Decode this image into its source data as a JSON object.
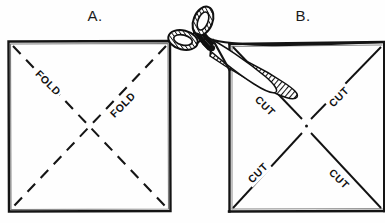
{
  "figure": {
    "background_color": "#fefefe",
    "ink_color": "#141414",
    "panels": [
      {
        "key": "A",
        "letter": "A.",
        "letter_x": 95,
        "letter_y": 21,
        "square": {
          "x": 8,
          "y": 41,
          "size": 162
        },
        "diagonal_style": "dashed",
        "labels": [
          {
            "text": "FOLD",
            "x": 47,
            "y": 84,
            "rotation": 45
          },
          {
            "text": "FOLD",
            "x": 124,
            "y": 106,
            "rotation": -45
          }
        ]
      },
      {
        "key": "B",
        "letter": "B.",
        "letter_x": 303,
        "letter_y": 21,
        "square": {
          "x": 229,
          "y": 41,
          "size": 162
        },
        "diagonal_style": "solid",
        "labels": [
          {
            "text": "CUT",
            "x": 264,
            "y": 107,
            "rotation": 45
          },
          {
            "text": "CUT",
            "x": 340,
            "y": 98,
            "rotation": -45
          },
          {
            "text": "CUT",
            "x": 259,
            "y": 174,
            "rotation": -45
          },
          {
            "text": "CUT",
            "x": 338,
            "y": 180,
            "rotation": 45
          }
        ]
      }
    ],
    "scissors": {
      "name": "scissors",
      "description": "open scissors with hatched blades and two looped handles, angled diagonally over the upper-left corner of panel B",
      "fill_pattern": "diagonal-hatch",
      "blade_angle_degrees": 38
    }
  }
}
